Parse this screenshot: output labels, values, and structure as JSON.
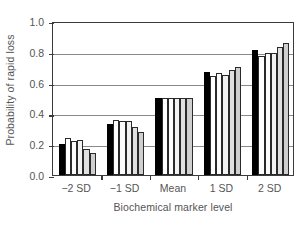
{
  "chart_data": {
    "type": "bar",
    "title": "",
    "xlabel": "Biochemical marker level",
    "ylabel": "Probability of rapid loss",
    "categories": [
      "−2 SD",
      "−1 SD",
      "Mean",
      "1 SD",
      "2 SD"
    ],
    "ylim": [
      0.0,
      1.0
    ],
    "yticks": [
      "1.0",
      "0.8",
      "0.6",
      "0.4",
      "0.2",
      "0.0"
    ],
    "ytick_values": [
      1.0,
      0.8,
      0.6,
      0.4,
      0.2,
      0.0
    ],
    "grid": true,
    "legend": "none",
    "bars_per_group": 6,
    "series": [
      {
        "name": "Series 1",
        "color": "#000000",
        "values": [
          0.2,
          0.33,
          0.5,
          0.67,
          0.81
        ]
      },
      {
        "name": "Series 2",
        "color": "#ffffff",
        "values": [
          0.24,
          0.36,
          0.5,
          0.64,
          0.77
        ]
      },
      {
        "name": "Series 3",
        "color": "#fcfcfc",
        "values": [
          0.22,
          0.35,
          0.5,
          0.66,
          0.79
        ]
      },
      {
        "name": "Series 4",
        "color": "#f2f2f2",
        "values": [
          0.23,
          0.35,
          0.5,
          0.65,
          0.79
        ]
      },
      {
        "name": "Series 5",
        "color": "#e0e0e0",
        "values": [
          0.17,
          0.31,
          0.5,
          0.68,
          0.83
        ]
      },
      {
        "name": "Series 6",
        "color": "#cfcfcf",
        "values": [
          0.14,
          0.28,
          0.5,
          0.7,
          0.86
        ]
      }
    ]
  },
  "axes": {
    "frame_color": "#3b3b3b",
    "grid_color": "#8a8a8a",
    "text_color": "#555555"
  }
}
